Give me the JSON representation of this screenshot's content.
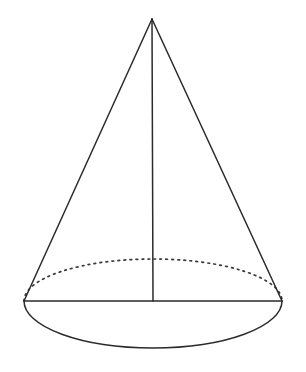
{
  "figure": {
    "background_color": "#ffffff",
    "stroke_color": "#2b2b2b",
    "dotted_stroke_color": "#3a3a3a",
    "stroke_width": 1.5,
    "dot_dash_pattern": "1.7 4.3"
  },
  "geometry": {
    "canvas": {
      "width": 306,
      "height": 372
    },
    "apex": {
      "x": 152,
      "y": 19
    },
    "base_center": {
      "x": 153,
      "y": 301
    },
    "base_left": {
      "x": 24,
      "y": 301
    },
    "base_right": {
      "x": 282,
      "y": 301
    },
    "base_ellipse": {
      "cx": 153,
      "cy": 301,
      "rx": 129,
      "ry": 47
    },
    "hidden_back_arc": {
      "cx": 153,
      "cy": 301,
      "rx": 129,
      "ry": 42
    },
    "axis": {
      "x1": 152,
      "y1": 19,
      "x2": 153,
      "y2": 301
    },
    "height_px": 282,
    "base_diameter_px": 258
  },
  "parts": {
    "apex_label": "apex",
    "left_slant_label": "left slant edge",
    "right_slant_label": "right slant edge",
    "axis_label": "central axis",
    "base_chord_label": "base diameter chord",
    "front_arc_label": "visible front base arc",
    "back_arc_label": "hidden back base arc"
  },
  "paths": {
    "left_slant": "M 152 19 L 24 301",
    "right_slant": "M 152 19 L 282 301",
    "axis": "M 152 19 L 153 301",
    "base_chord": "M 24 301 L 282 301",
    "front_arc": "M 24 301 A 129 47 0 0 0 282 301",
    "back_arc": "M 24 301 A 129 42 0 0 1 282 301"
  }
}
